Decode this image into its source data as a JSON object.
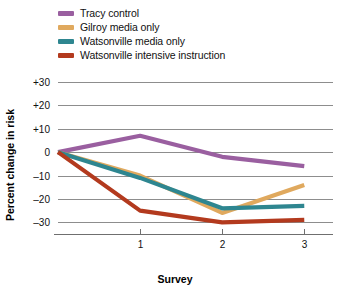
{
  "figure": {
    "background_color": "#ffffff"
  },
  "legend": {
    "position": "top-left",
    "entries": [
      {
        "label": "Tracy control",
        "color": "#9a5fa0",
        "swatch_name": "legend-swatch-tracy-control"
      },
      {
        "label": "Gilroy media only",
        "color": "#e0a95e",
        "swatch_name": "legend-swatch-gilroy-media-only"
      },
      {
        "label": "Watsonville media only",
        "color": "#2e8690",
        "swatch_name": "legend-swatch-watsonville-media-only"
      },
      {
        "label": "Watsonville intensive instruction",
        "color": "#b33a1e",
        "swatch_name": "legend-swatch-watsonville-intensive-instruction"
      }
    ]
  },
  "axes": {
    "y_label": "Percent change in risk",
    "x_label": "Survey",
    "y_ticks": [
      "+30",
      "+20",
      "+10",
      "0",
      "–10",
      "–20",
      "–30"
    ],
    "x_ticks": [
      "1",
      "2",
      "3"
    ]
  },
  "chart_data": {
    "type": "line",
    "title": "",
    "xlabel": "Survey",
    "ylabel": "Percent change in risk",
    "x": [
      0,
      1,
      2,
      3
    ],
    "categories": [
      "0",
      "1",
      "2",
      "3"
    ],
    "xlim": [
      0,
      3.35
    ],
    "ylim": [
      -35,
      30
    ],
    "ytick_values": [
      30,
      20,
      10,
      0,
      -10,
      -20,
      -30
    ],
    "ytick_labels": [
      "+30",
      "+20",
      "+10",
      "0",
      "–10",
      "–20",
      "–30"
    ],
    "xtick_values": [
      1,
      2,
      3
    ],
    "xtick_labels": [
      "1",
      "2",
      "3"
    ],
    "grid": true,
    "grid_axis": "y",
    "legend_position": "above-plot-left",
    "series": [
      {
        "name": "Tracy control",
        "color": "#9a5fa0",
        "values": [
          0,
          7,
          -2,
          -6
        ]
      },
      {
        "name": "Gilroy media only",
        "color": "#e0a95e",
        "values": [
          0,
          -10,
          -26,
          -14
        ]
      },
      {
        "name": "Watsonville media only",
        "color": "#2e8690",
        "values": [
          0,
          -11,
          -24,
          -23
        ]
      },
      {
        "name": "Watsonville intensive instruction",
        "color": "#b33a1e",
        "values": [
          0,
          -25,
          -30,
          -29
        ]
      }
    ]
  }
}
